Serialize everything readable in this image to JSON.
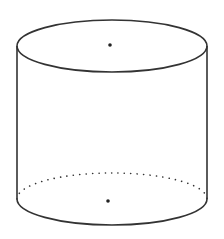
{
  "diagram": {
    "shape": "cylinder",
    "stroke_color": "#333333",
    "background": "#ffffff",
    "top_ellipse": {
      "cx": 112,
      "cy": 46,
      "rx": 95,
      "ry": 26
    },
    "bottom_ellipse": {
      "cx": 112,
      "cy": 199,
      "rx": 95,
      "ry": 26
    },
    "top_center_point": {
      "x": 110,
      "y": 45
    },
    "bottom_center_point": {
      "x": 108,
      "y": 201
    },
    "hidden_edge_style": "dotted"
  }
}
